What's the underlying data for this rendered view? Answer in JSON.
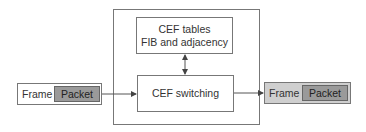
{
  "diagram": {
    "title": "",
    "router": {
      "cef_tables": {
        "line1": "CEF tables",
        "line2": "FIB and adjacency"
      },
      "cef_switching": {
        "label": "CEF switching"
      }
    },
    "input_frame": {
      "frame_label": "Frame",
      "packet_label": "Packet"
    },
    "output_frame": {
      "frame_label": "Frame",
      "packet_label": "Packet"
    },
    "colors": {
      "border": "#777777",
      "packet_fill": "#9a9a9a",
      "output_frame_fill": "#cfcfcf",
      "background": "#ffffff"
    }
  }
}
